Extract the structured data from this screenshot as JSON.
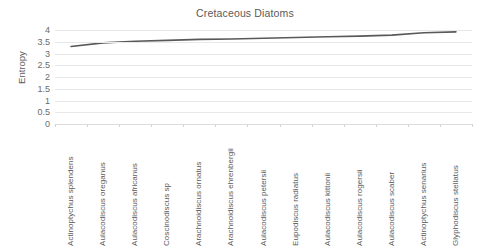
{
  "chart_data": {
    "type": "line",
    "title": "Cretaceous Diatoms",
    "xlabel": "",
    "ylabel": "Entropy",
    "ylim": [
      0,
      4
    ],
    "ytick_step": 0.5,
    "yticks": [
      "0",
      "0.5",
      "1",
      "1.5",
      "2",
      "2.5",
      "3",
      "3.5",
      "4"
    ],
    "grid": true,
    "legend": "none",
    "line_color": "#595959",
    "categories": [
      "Actinoptychus splendens",
      "Aulacodiscus oreganus",
      "Aulacodiscus africanus",
      "Coscinodiscus sp",
      "Arachnoidiscus ornatus",
      "Arachnoidiscus ehrenbergii",
      "Aulacodiscus petersii",
      "Eupodiscus radiatus",
      "Aulacodiscus kittonii",
      "Aulacodiscus rogersii",
      "Aulacodiscus scaber",
      "Actinoptychus senarius",
      "Glyphodiscus stellatus"
    ],
    "series": [
      {
        "name": "Entropy",
        "values": [
          3.3,
          3.45,
          3.52,
          3.56,
          3.6,
          3.62,
          3.65,
          3.68,
          3.71,
          3.74,
          3.78,
          3.88,
          3.92
        ]
      }
    ]
  }
}
